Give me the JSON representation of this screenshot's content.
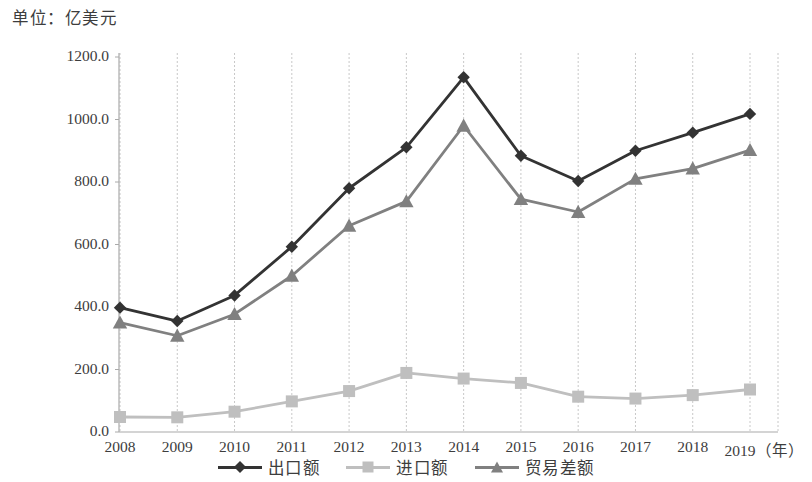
{
  "unit_label": "单位：亿美元",
  "colors": {
    "exports": "#333333",
    "imports": "#bfbfbf",
    "balance": "#808080",
    "axis": "#aaaaaa",
    "grid": "#c8c8c8",
    "text": "#3d3d3d"
  },
  "legend": {
    "items": [
      {
        "label": "出口额",
        "marker": "diamond",
        "color": "#333333"
      },
      {
        "label": "进口额",
        "marker": "square",
        "color": "#bfbfbf"
      },
      {
        "label": "贸易差额",
        "marker": "triangle",
        "color": "#808080"
      }
    ]
  },
  "axes": {
    "x_suffix": "（年）",
    "y_ticks": [
      "0.0",
      "200.0",
      "400.0",
      "600.0",
      "800.0",
      "1000.0",
      "1200.0"
    ],
    "x_ticks": [
      "2008",
      "2009",
      "2010",
      "2011",
      "2012",
      "2013",
      "2014",
      "2015",
      "2016",
      "2017",
      "2018",
      "2019"
    ]
  },
  "chart_data": {
    "type": "line",
    "title": "单位：亿美元",
    "xlabel": "（年）",
    "ylabel": "亿美元",
    "ylim": [
      0,
      1200
    ],
    "ytick_step": 200,
    "grid": "vertical",
    "legend_position": "bottom-center",
    "categories": [
      "2008",
      "2009",
      "2010",
      "2011",
      "2012",
      "2013",
      "2014",
      "2015",
      "2016",
      "2017",
      "2018",
      "2019"
    ],
    "series": [
      {
        "name": "出口额",
        "marker": "diamond",
        "color": "#333333",
        "values": [
          398,
          355,
          437,
          593,
          780,
          911,
          1135,
          884,
          803,
          900,
          958,
          1018
        ]
      },
      {
        "name": "进口额",
        "marker": "square",
        "color": "#bfbfbf",
        "values": [
          48,
          47,
          65,
          98,
          131,
          189,
          171,
          157,
          113,
          107,
          118,
          136
        ]
      },
      {
        "name": "贸易差额",
        "marker": "triangle",
        "color": "#808080",
        "values": [
          350,
          308,
          377,
          500,
          660,
          738,
          980,
          745,
          704,
          810,
          843,
          902
        ]
      }
    ]
  }
}
